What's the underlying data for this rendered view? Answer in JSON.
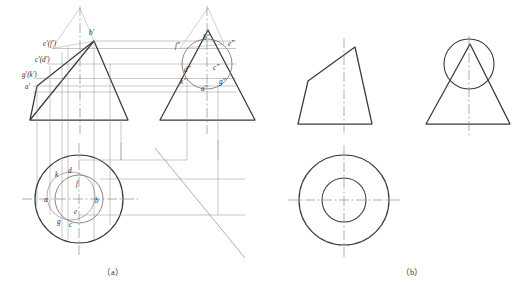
{
  "figure": {
    "caption_a": "（a）",
    "caption_b": "（b）",
    "colors": {
      "outline": "#3a3a3a",
      "thin_line": "#8c8c8c",
      "center_line": "#7a7a7a",
      "label_text": "#2b2b2b",
      "background": "#ffffff"
    }
  },
  "part_a": {
    "name": "(a)",
    "front_view": {
      "name": "front-view",
      "labels": [
        {
          "id": "e-f-prime",
          "text": "e'(f')",
          "x": 43,
          "y": 46
        },
        {
          "id": "b-prime",
          "text": "b'",
          "x": 89,
          "y": 35
        },
        {
          "id": "c-d-prime",
          "text": "c'(d')",
          "x": 35,
          "y": 62
        },
        {
          "id": "g-k-prime",
          "text": "g'(k')",
          "x": 22,
          "y": 77
        },
        {
          "id": "a-prime",
          "text": "a'",
          "x": 25,
          "y": 89
        }
      ]
    },
    "side_view": {
      "name": "side-view",
      "labels": [
        {
          "id": "f-double-prime",
          "text": "f\"",
          "x": 175,
          "y": 48
        },
        {
          "id": "b-double-prime",
          "text": "b\"",
          "x": 203,
          "y": 40
        },
        {
          "id": "e-double-prime",
          "text": "e\"",
          "x": 228,
          "y": 46
        },
        {
          "id": "d-double-prime",
          "text": "d\"",
          "x": 184,
          "y": 72
        },
        {
          "id": "c-double-prime",
          "text": "c\"",
          "x": 213,
          "y": 70
        },
        {
          "id": "k-double-prime",
          "text": "k\"",
          "x": 180,
          "y": 84
        },
        {
          "id": "g-double-prime",
          "text": "g\"",
          "x": 219,
          "y": 84
        },
        {
          "id": "a-double-prime",
          "text": "a\"",
          "x": 201,
          "y": 91
        }
      ]
    },
    "top_view": {
      "name": "top-view",
      "labels": [
        {
          "id": "k",
          "text": "k",
          "x": 55,
          "y": 177
        },
        {
          "id": "d",
          "text": "d",
          "x": 68,
          "y": 173
        },
        {
          "id": "f",
          "text": "f",
          "x": 76,
          "y": 186
        },
        {
          "id": "a",
          "text": "a",
          "x": 44,
          "y": 202
        },
        {
          "id": "b",
          "text": "b",
          "x": 95,
          "y": 203
        },
        {
          "id": "e",
          "text": "e",
          "x": 74,
          "y": 214
        },
        {
          "id": "g",
          "text": "g",
          "x": 57,
          "y": 224
        },
        {
          "id": "c",
          "text": "c",
          "x": 69,
          "y": 227
        }
      ]
    }
  },
  "part_b": {
    "name": "(b)",
    "front_view": {
      "name": "front-view"
    },
    "side_view": {
      "name": "side-view"
    },
    "top_view": {
      "name": "top-view"
    }
  }
}
